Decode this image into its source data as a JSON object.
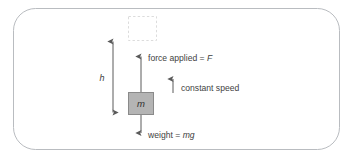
{
  "figure": {
    "name": "lifting-a-mass-at-constant-speed",
    "frame": {
      "shape": "rounded-rectangle",
      "stroke_color": "#b9bcc0",
      "fill_color": "#ffffff"
    },
    "ghost_block": {
      "label": "",
      "style": "dashed-outline",
      "stroke_color": "#dcdcdc",
      "meaning": "final-position-of-mass"
    },
    "mass_block": {
      "symbol": "m",
      "fill_color": "#b4b4b4",
      "stroke_color": "#8a8a8a"
    },
    "height_label": "h",
    "arrows": {
      "height": {
        "name": "height-double-arrow",
        "direction": "both",
        "color": "#5a5a5a"
      },
      "force": {
        "name": "force-arrow",
        "direction": "up",
        "color": "#5a5a5a"
      },
      "weight": {
        "name": "weight-arrow",
        "direction": "down",
        "color": "#5a5a5a"
      },
      "speed": {
        "name": "constant-speed-arrow",
        "direction": "up",
        "color": "#5a5a5a"
      }
    },
    "labels": {
      "force": {
        "prefix": "force applied = ",
        "symbol": "F"
      },
      "speed": {
        "text": "constant speed"
      },
      "weight": {
        "prefix": "weight = ",
        "symbol": "mg"
      }
    }
  }
}
